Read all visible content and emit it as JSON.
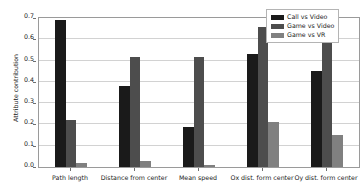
{
  "chart_data": {
    "type": "bar",
    "title": "",
    "xlabel": "",
    "ylabel": "Attribute contribution",
    "ylim": [
      0.0,
      0.7
    ],
    "yticks": [
      "0.0",
      "0.1",
      "0.2",
      "0.3",
      "0.4",
      "0.5",
      "0.6",
      "0.7"
    ],
    "ytick_values": [
      0.0,
      0.1,
      0.2,
      0.3,
      0.4,
      0.5,
      0.6,
      0.7
    ],
    "grid": true,
    "legend_position": "upper right",
    "categories": [
      "Path length",
      "Distance from center",
      "Mean speed",
      "Ox dist. form center",
      "Oy dist. form center"
    ],
    "series": [
      {
        "name": "Call vs Video",
        "color": "#1a1a1a",
        "values": [
          0.69,
          0.38,
          0.19,
          0.53,
          0.45
        ]
      },
      {
        "name": "Game vs Video",
        "color": "#4d4d4d",
        "values": [
          0.22,
          0.515,
          0.515,
          0.66,
          0.6
        ]
      },
      {
        "name": "Game vs VR",
        "color": "#808080",
        "values": [
          0.02,
          0.03,
          0.01,
          0.21,
          0.15
        ]
      }
    ]
  },
  "axes": {
    "frame_color": "#9a9a9a",
    "grid_color": "#d2d2d2",
    "tick_color": "#6f6f6f",
    "background": "#ffffff"
  }
}
